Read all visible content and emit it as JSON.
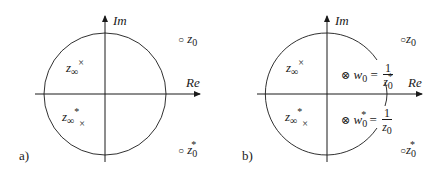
{
  "figure": {
    "panels": [
      {
        "id": "a",
        "tag": "a)",
        "axes": {
          "real_label": "Re",
          "imag_label": "Im"
        },
        "circle": "unit circle",
        "points": {
          "z_inf": {
            "symbol": "z",
            "sub": "∞",
            "sup": "×",
            "marker": "×"
          },
          "z_inf_conj": {
            "symbol": "z",
            "sub": "∞",
            "sup": "*",
            "marker": "×"
          },
          "z0": {
            "symbol": "z",
            "sub": "0",
            "marker": "○"
          },
          "z0_conj": {
            "symbol": "z",
            "sub": "0",
            "sup": "*",
            "marker": "○"
          }
        }
      },
      {
        "id": "b",
        "tag": "b)",
        "axes": {
          "real_label": "Re",
          "imag_label": "Im"
        },
        "circle": "unit circle (deformed around w0)",
        "points": {
          "z_inf": {
            "symbol": "z",
            "sub": "∞",
            "sup": "×",
            "marker": "×"
          },
          "z_inf_conj": {
            "symbol": "z",
            "sub": "∞",
            "sup": "*",
            "marker": "×"
          },
          "z0": {
            "symbol": "z",
            "sub": "0",
            "marker": "○"
          },
          "z0_conj": {
            "symbol": "z",
            "sub": "0",
            "sup": "*",
            "marker": "○"
          },
          "w0": {
            "marker": "⊗",
            "symbol": "w",
            "sub": "0",
            "eq": "=",
            "num": "1",
            "den_symbol": "z",
            "den_sub": "0",
            "den_sup": "*"
          },
          "w0_conj": {
            "marker": "⊗",
            "symbol": "w",
            "sub": "0",
            "sup": "*",
            "eq": "=",
            "num": "1",
            "den_symbol": "z",
            "den_sub": "0"
          }
        }
      }
    ],
    "colors": {
      "line": "#1a1a1a",
      "background": "#ffffff"
    }
  }
}
